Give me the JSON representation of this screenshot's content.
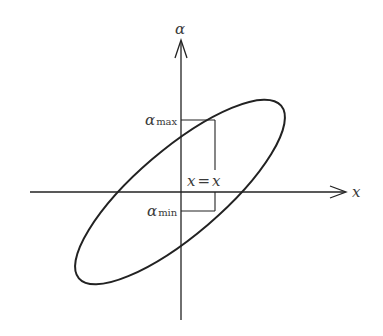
{
  "diagram": {
    "y_axis_label": "α",
    "x_axis_label": "x",
    "alpha_max_label": {
      "symbol": "α",
      "subscript": "max"
    },
    "alpha_min_label": {
      "symbol": "α",
      "subscript": "min"
    },
    "center_label": "x = x",
    "center_label_left": "x",
    "center_label_eq": "=",
    "center_label_right": "x",
    "colors": {
      "stroke": "#222222",
      "text": "#3a3a3a",
      "background": "#ffffff"
    }
  }
}
